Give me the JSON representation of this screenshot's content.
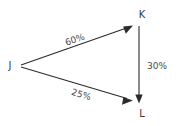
{
  "diagram": {
    "type": "directed-graph",
    "background_color": "#ffffff",
    "line_color": "#2b2b2b",
    "text_color": "#3a3a3a",
    "nodes": [
      {
        "id": "J",
        "label": "J",
        "x": 10,
        "y": 66
      },
      {
        "id": "K",
        "label": "K",
        "x": 142,
        "y": 15
      },
      {
        "id": "L",
        "label": "L",
        "x": 142,
        "y": 114
      }
    ],
    "edges": [
      {
        "id": "j-to-k",
        "from": "J",
        "to": "K",
        "label": "60%",
        "value": 60,
        "unit": "%",
        "label_x": 75,
        "label_y": 40,
        "label_rotation": -19.5,
        "x1": 21,
        "y1": 65,
        "x2": 132,
        "y2": 26
      },
      {
        "id": "j-to-l",
        "from": "J",
        "to": "L",
        "label": "25%",
        "value": 25,
        "unit": "%",
        "label_x": 81,
        "label_y": 95,
        "label_rotation": 17.0,
        "x1": 21,
        "y1": 67,
        "x2": 132,
        "y2": 100
      },
      {
        "id": "k-to-l",
        "from": "K",
        "to": "L",
        "label": "30%",
        "value": 30,
        "unit": "%",
        "label_x": 157,
        "label_y": 66,
        "label_rotation": 0,
        "x1": 139,
        "y1": 26,
        "x2": 139,
        "y2": 102
      }
    ]
  }
}
